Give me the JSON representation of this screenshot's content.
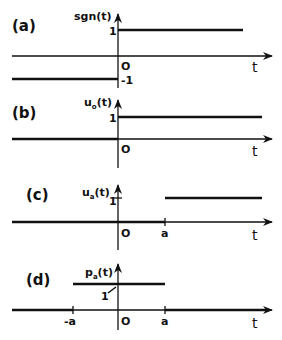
{
  "colors": {
    "ink": "#111111",
    "background": "#ffffff"
  },
  "panels": [
    {
      "id": "a",
      "label": "(a)",
      "function_label": "sgn(t)",
      "origin_label": "O",
      "axis_label": "t",
      "level_labels": [
        "1",
        "-1"
      ],
      "description": "Signum function: -1 for t<0, 1 for t>0"
    },
    {
      "id": "b",
      "label": "(b)",
      "function_label": "u",
      "function_subscript": "o",
      "function_suffix": "(t)",
      "origin_label": "O",
      "axis_label": "t",
      "level_labels": [
        "1"
      ],
      "description": "Unit step at t=0"
    },
    {
      "id": "c",
      "label": "(c)",
      "function_label": "u",
      "function_subscript": "a",
      "function_suffix": "(t)",
      "origin_label": "O",
      "axis_label": "t",
      "level_labels": [
        "1"
      ],
      "tick_labels": [
        "a"
      ],
      "description": "Unit step shifted to t=a"
    },
    {
      "id": "d",
      "label": "(d)",
      "function_label": "p",
      "function_subscript": "a",
      "function_suffix": "(t)",
      "origin_label": "O",
      "axis_label": "t",
      "level_labels": [
        "1"
      ],
      "tick_labels": [
        "-a",
        "a"
      ],
      "description": "Rectangular pulse from -a to a with height 1"
    }
  ]
}
